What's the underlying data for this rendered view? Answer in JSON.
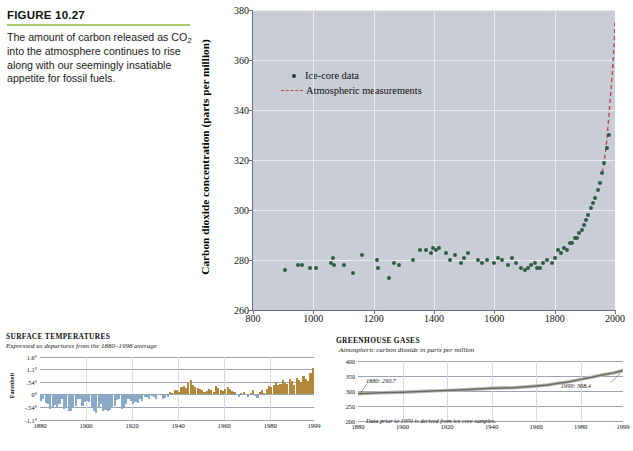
{
  "figure": {
    "label": "FIGURE 10.27",
    "rule_color": "#a9c66a",
    "caption_part1": "The amount of carbon released as CO",
    "caption_sub": "2",
    "caption_part2": " into the atmosphere continues to rise along with our seemingly insatiable appetite for fossil fuels."
  },
  "credit": "",
  "chart_data": [
    {
      "id": "main",
      "type": "scatter",
      "title": "",
      "xlabel": "",
      "ylabel": "Carbon dioxide concentration (parts per million)",
      "xlim": [
        800,
        2000
      ],
      "ylim": [
        260,
        380
      ],
      "xticks": [
        800,
        1000,
        1200,
        1400,
        1600,
        1800,
        2000
      ],
      "yticks": [
        260,
        280,
        300,
        320,
        340,
        360,
        380
      ],
      "grid": true,
      "plot_bg": "#c9cdd5",
      "legend_position": "top-left",
      "legend": [
        {
          "name": "Ice-core data",
          "marker": "dot",
          "color": "#2f5c43"
        },
        {
          "name": "Atmospheric measurements",
          "marker": "dashed-line",
          "color": "#b8484a"
        }
      ],
      "series": [
        {
          "name": "Ice-core data",
          "color": "#2f5c43",
          "points": [
            [
              905,
              276
            ],
            [
              950,
              278
            ],
            [
              963,
              278
            ],
            [
              988,
              277
            ],
            [
              1010,
              277
            ],
            [
              1060,
              279
            ],
            [
              1065,
              281
            ],
            [
              1068,
              278
            ],
            [
              1100,
              278
            ],
            [
              1130,
              275
            ],
            [
              1160,
              282
            ],
            [
              1210,
              280
            ],
            [
              1215,
              277
            ],
            [
              1252,
              273
            ],
            [
              1268,
              279
            ],
            [
              1285,
              278
            ],
            [
              1330,
              280
            ],
            [
              1355,
              284
            ],
            [
              1372,
              284
            ],
            [
              1390,
              283
            ],
            [
              1398,
              285
            ],
            [
              1408,
              284
            ],
            [
              1418,
              285
            ],
            [
              1440,
              283
            ],
            [
              1452,
              280
            ],
            [
              1468,
              282
            ],
            [
              1490,
              279
            ],
            [
              1500,
              281
            ],
            [
              1512,
              283
            ],
            [
              1545,
              280
            ],
            [
              1560,
              279
            ],
            [
              1575,
              280
            ],
            [
              1600,
              279
            ],
            [
              1612,
              281
            ],
            [
              1625,
              280
            ],
            [
              1645,
              278
            ],
            [
              1660,
              281
            ],
            [
              1672,
              279
            ],
            [
              1690,
              277
            ],
            [
              1700,
              276
            ],
            [
              1712,
              277
            ],
            [
              1720,
              278
            ],
            [
              1735,
              279
            ],
            [
              1740,
              277
            ],
            [
              1750,
              277
            ],
            [
              1762,
              279
            ],
            [
              1775,
              280
            ],
            [
              1790,
              279
            ],
            [
              1800,
              281
            ],
            [
              1810,
              284
            ],
            [
              1820,
              283
            ],
            [
              1830,
              285
            ],
            [
              1840,
              284
            ],
            [
              1850,
              287
            ],
            [
              1858,
              287
            ],
            [
              1866,
              289
            ],
            [
              1875,
              289
            ],
            [
              1882,
              291
            ],
            [
              1890,
              292
            ],
            [
              1898,
              294
            ],
            [
              1905,
              296
            ],
            [
              1912,
              298
            ],
            [
              1920,
              301
            ],
            [
              1928,
              303
            ],
            [
              1935,
              305
            ],
            [
              1942,
              308
            ],
            [
              1950,
              311
            ],
            [
              1958,
              315
            ],
            [
              1965,
              319
            ],
            [
              1972,
              325
            ],
            [
              1980,
              330
            ]
          ]
        },
        {
          "name": "Atmospheric measurements",
          "color": "#b8484a",
          "style": "dashed",
          "points": [
            [
              1958,
              315
            ],
            [
              1965,
              320
            ],
            [
              1972,
              327
            ],
            [
              1980,
              338
            ],
            [
              1986,
              347
            ],
            [
              1992,
              356
            ],
            [
              1998,
              368
            ],
            [
              2000,
              376
            ]
          ]
        }
      ]
    },
    {
      "id": "surface-temperatures",
      "type": "bar",
      "title": "SURFACE TEMPERATURES",
      "subtitle": "Expressed as departures from the 1880–1998 average",
      "ylabel": "Farenheit",
      "xlabel": "",
      "xlim": [
        1880,
        1999
      ],
      "ylim": [
        -1.1,
        1.6
      ],
      "yticks": [
        "1.6°",
        "1.1°",
        ".54°",
        "0°",
        "-.54°",
        "-1.1°"
      ],
      "ytick_values": [
        1.6,
        1.1,
        0.54,
        0,
        -0.54,
        -1.1
      ],
      "xticks": [
        1880,
        1900,
        1920,
        1940,
        1960,
        1980,
        1999
      ],
      "colors": {
        "below": "#8aa9c6",
        "above": "#b2883a"
      },
      "values": [
        -0.3,
        -0.2,
        -0.38,
        -0.42,
        -0.62,
        -0.55,
        -0.44,
        -0.6,
        -0.4,
        -0.18,
        -0.62,
        -0.55,
        -0.7,
        -0.72,
        -0.58,
        -0.48,
        -0.22,
        -0.2,
        -0.5,
        -0.35,
        -0.28,
        -0.35,
        -0.55,
        -0.7,
        -0.8,
        -0.58,
        -0.42,
        -0.72,
        -0.68,
        -0.7,
        -0.68,
        -0.58,
        -0.52,
        -0.25,
        -0.2,
        -0.62,
        -0.58,
        -0.4,
        -0.22,
        -0.3,
        -0.42,
        -0.32,
        -0.38,
        -0.2,
        -0.3,
        -0.1,
        -0.12,
        -0.22,
        -0.08,
        -0.12,
        -0.18,
        -0.05,
        0.02,
        -0.22,
        -0.15,
        -0.1,
        0.1,
        0.05,
        0.18,
        0.2,
        0.12,
        0.3,
        0.34,
        0.26,
        0.5,
        0.6,
        0.4,
        0.32,
        0.28,
        0.24,
        0.18,
        0.1,
        0.15,
        0.25,
        0.2,
        0.12,
        0.34,
        0.28,
        0.2,
        0.14,
        0.24,
        0.3,
        0.22,
        0.15,
        0.08,
        -0.05,
        -0.1,
        0.05,
        0.12,
        -0.04,
        -0.12,
        0.06,
        0.2,
        -0.08,
        -0.15,
        0.1,
        0.18,
        0.05,
        0.22,
        0.36,
        0.3,
        0.42,
        0.55,
        0.38,
        0.46,
        0.62,
        0.5,
        0.44,
        0.66,
        0.58,
        0.4,
        0.72,
        0.6,
        0.52,
        0.78,
        0.64,
        0.56,
        0.9,
        1.12
      ]
    },
    {
      "id": "greenhouse-gases",
      "type": "line",
      "title": "GREENHOUSE GASES",
      "subtitle": "Atmospheric carbon dioxide in parts per million",
      "note": "Data prior to 1959 is derived from ice core samples.",
      "xlabel": "",
      "ylabel": "",
      "xlim": [
        1880,
        1999
      ],
      "ylim": [
        200,
        400
      ],
      "yticks": [
        200,
        250,
        300,
        350,
        400
      ],
      "xticks": [
        1880,
        1900,
        1920,
        1940,
        1960,
        1980,
        1999
      ],
      "annotations": [
        {
          "text": "1880: 290.7",
          "x": 1880,
          "y": 290.7
        },
        {
          "text": "1999: 368.4",
          "x": 1999,
          "y": 368.4
        }
      ],
      "line_color": "#8d8d86",
      "points": [
        [
          1880,
          290.7
        ],
        [
          1890,
          294.0
        ],
        [
          1900,
          296.0
        ],
        [
          1910,
          299.0
        ],
        [
          1920,
          302.0
        ],
        [
          1930,
          305.0
        ],
        [
          1940,
          309.0
        ],
        [
          1950,
          311.0
        ],
        [
          1959,
          315.9
        ],
        [
          1965,
          320.0
        ],
        [
          1970,
          325.7
        ],
        [
          1975,
          331.1
        ],
        [
          1980,
          338.7
        ],
        [
          1985,
          346.0
        ],
        [
          1990,
          354.2
        ],
        [
          1995,
          360.6
        ],
        [
          1999,
          368.4
        ]
      ]
    }
  ]
}
